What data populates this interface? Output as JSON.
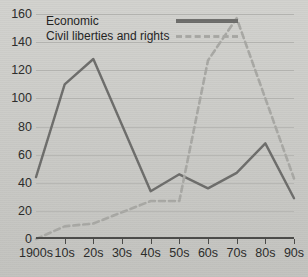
{
  "chart_data": {
    "type": "line",
    "title": "",
    "xlabel": "",
    "ylabel": "",
    "categories": [
      "1900s",
      "10s",
      "20s",
      "30s",
      "40s",
      "50s",
      "60s",
      "70s",
      "80s",
      "90s"
    ],
    "ylim": [
      0,
      160
    ],
    "yticks": [
      0,
      20,
      40,
      60,
      80,
      100,
      120,
      140,
      160
    ],
    "grid": true,
    "legend_position": "top-left",
    "series": [
      {
        "name": "Economic",
        "style": "solid",
        "color": "#6d6d6b",
        "values": [
          44,
          110,
          128,
          81,
          34,
          46,
          36,
          47,
          68,
          29
        ]
      },
      {
        "name": "Civil liberties and rights",
        "style": "dashed",
        "color": "#a8a8a4",
        "values": [
          0,
          9,
          11,
          19,
          27,
          27,
          127,
          157,
          100,
          43
        ]
      }
    ]
  },
  "axis": {
    "y_tick_labels": [
      "0",
      "20",
      "40",
      "60",
      "80",
      "100",
      "120",
      "140",
      "160"
    ],
    "x_tick_labels": [
      "1900s",
      "10s",
      "20s",
      "30s",
      "40s",
      "50s",
      "60s",
      "70s",
      "80s",
      "90s"
    ]
  },
  "legend": {
    "entries": [
      {
        "label": "Economic",
        "key": "solid-line-key"
      },
      {
        "label": "Civil liberties and rights",
        "key": "dashed-line-key"
      }
    ]
  },
  "colors": {
    "background": "#cdcdc9",
    "grid": "#b6b6b2",
    "axis": "#4a4a48",
    "series_economic": "#6d6d6b",
    "series_civil": "#a8a8a4",
    "text": "#2b2b2a"
  }
}
